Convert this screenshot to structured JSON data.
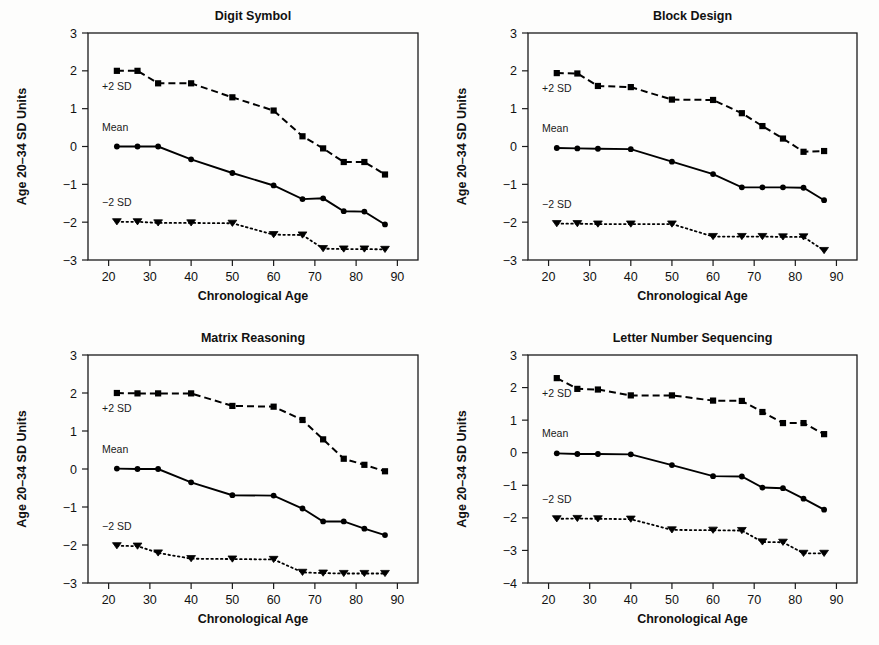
{
  "figure": {
    "background": "#fdfdfc",
    "ink": "#000000",
    "xlabel": "Chronological Age",
    "ylabel": "Age 20–34 SD Units",
    "x_ticks": [
      20,
      30,
      40,
      50,
      60,
      70,
      80,
      90
    ],
    "xlim": [
      15,
      95
    ],
    "series_annotations": {
      "upper": "+2 SD",
      "middle": "Mean",
      "lower": "−2 SD"
    }
  },
  "chart_data": [
    {
      "type": "line",
      "panel": "top-left",
      "title": "Digit Symbol",
      "xlabel": "Chronological Age",
      "ylabel": "Age 20–34 SD Units",
      "xlim": [
        15,
        95
      ],
      "ylim": [
        -3,
        3
      ],
      "x_ticks": [
        20,
        30,
        40,
        50,
        60,
        70,
        80,
        90
      ],
      "y_ticks": [
        -3,
        -2,
        -1,
        0,
        1,
        2,
        3
      ],
      "grid": false,
      "legend": "inline-annotations",
      "x": [
        22,
        27,
        32,
        40,
        50,
        60,
        67,
        72,
        77,
        82,
        87
      ],
      "series": [
        {
          "name": "+2 SD",
          "style": "dashed",
          "marker": "square",
          "values": [
            2.0,
            2.0,
            1.67,
            1.67,
            1.3,
            0.95,
            0.27,
            -0.05,
            -0.41,
            -0.41,
            -0.74
          ]
        },
        {
          "name": "Mean",
          "style": "solid",
          "marker": "circle",
          "values": [
            0.0,
            0.0,
            0.0,
            -0.34,
            -0.7,
            -1.03,
            -1.39,
            -1.37,
            -1.71,
            -1.72,
            -2.06
          ]
        },
        {
          "name": "−2 SD",
          "style": "dotted",
          "marker": "triangle-down",
          "values": [
            -1.99,
            -1.99,
            -2.02,
            -2.02,
            -2.03,
            -2.33,
            -2.34,
            -2.7,
            -2.71,
            -2.71,
            -2.72
          ]
        }
      ]
    },
    {
      "type": "line",
      "panel": "top-right",
      "title": "Block Design",
      "xlabel": "Chronological Age",
      "ylabel": "Age 20–34 SD Units",
      "xlim": [
        15,
        95
      ],
      "ylim": [
        -3,
        3
      ],
      "x_ticks": [
        20,
        30,
        40,
        50,
        60,
        70,
        80,
        90
      ],
      "y_ticks": [
        -3,
        -2,
        -1,
        0,
        1,
        2,
        3
      ],
      "grid": false,
      "legend": "inline-annotations",
      "x": [
        22,
        27,
        32,
        40,
        50,
        60,
        67,
        72,
        77,
        82,
        87
      ],
      "series": [
        {
          "name": "+2 SD",
          "style": "dashed",
          "marker": "square",
          "values": [
            1.94,
            1.93,
            1.6,
            1.57,
            1.24,
            1.23,
            0.88,
            0.54,
            0.21,
            -0.14,
            -0.12
          ]
        },
        {
          "name": "Mean",
          "style": "solid",
          "marker": "circle",
          "values": [
            -0.04,
            -0.05,
            -0.06,
            -0.07,
            -0.4,
            -0.73,
            -1.08,
            -1.08,
            -1.08,
            -1.09,
            -1.42
          ]
        },
        {
          "name": "−2 SD",
          "style": "dotted",
          "marker": "triangle-down",
          "values": [
            -2.04,
            -2.04,
            -2.05,
            -2.05,
            -2.05,
            -2.38,
            -2.38,
            -2.38,
            -2.39,
            -2.39,
            -2.75
          ]
        }
      ]
    },
    {
      "type": "line",
      "panel": "bottom-left",
      "title": "Matrix Reasoning",
      "xlabel": "Chronological Age",
      "ylabel": "Age 20–34 SD Units",
      "xlim": [
        15,
        95
      ],
      "ylim": [
        -3,
        3
      ],
      "x_ticks": [
        20,
        30,
        40,
        50,
        60,
        70,
        80,
        90
      ],
      "y_ticks": [
        -3,
        -2,
        -1,
        0,
        1,
        2,
        3
      ],
      "grid": false,
      "legend": "inline-annotations",
      "x": [
        22,
        27,
        32,
        40,
        50,
        60,
        67,
        72,
        77,
        82,
        87
      ],
      "series": [
        {
          "name": "+2 SD",
          "style": "dashed",
          "marker": "square",
          "values": [
            2.0,
            1.99,
            1.99,
            1.99,
            1.66,
            1.64,
            1.29,
            0.78,
            0.27,
            0.11,
            -0.06
          ]
        },
        {
          "name": "Mean",
          "style": "solid",
          "marker": "circle",
          "values": [
            0.01,
            0.0,
            0.0,
            -0.35,
            -0.69,
            -0.7,
            -1.04,
            -1.38,
            -1.38,
            -1.57,
            -1.74
          ]
        },
        {
          "name": "−2 SD",
          "style": "dotted",
          "marker": "triangle-down",
          "values": [
            -2.02,
            -2.03,
            -2.21,
            -2.36,
            -2.37,
            -2.38,
            -2.72,
            -2.74,
            -2.75,
            -2.75,
            -2.75
          ]
        }
      ]
    },
    {
      "type": "line",
      "panel": "bottom-right",
      "title": "Letter Number Sequencing",
      "xlabel": "Chronological Age",
      "ylabel": "Age 20–34 SD Units",
      "xlim": [
        15,
        95
      ],
      "ylim": [
        -4,
        3
      ],
      "x_ticks": [
        20,
        30,
        40,
        50,
        60,
        70,
        80,
        90
      ],
      "y_ticks": [
        -4,
        -3,
        -2,
        -1,
        0,
        1,
        2,
        3
      ],
      "grid": false,
      "legend": "inline-annotations",
      "x": [
        22,
        27,
        32,
        40,
        50,
        60,
        67,
        72,
        77,
        82,
        87
      ],
      "series": [
        {
          "name": "+2 SD",
          "style": "dashed",
          "marker": "square",
          "values": [
            2.29,
            1.96,
            1.94,
            1.76,
            1.76,
            1.6,
            1.59,
            1.25,
            0.91,
            0.91,
            0.57
          ]
        },
        {
          "name": "Mean",
          "style": "solid",
          "marker": "circle",
          "values": [
            -0.02,
            -0.04,
            -0.04,
            -0.05,
            -0.38,
            -0.72,
            -0.73,
            -1.07,
            -1.09,
            -1.41,
            -1.75
          ]
        },
        {
          "name": "−2 SD",
          "style": "dotted",
          "marker": "triangle-down",
          "values": [
            -2.03,
            -2.02,
            -2.03,
            -2.04,
            -2.37,
            -2.38,
            -2.39,
            -2.74,
            -2.75,
            -3.09,
            -3.09
          ]
        }
      ]
    }
  ]
}
